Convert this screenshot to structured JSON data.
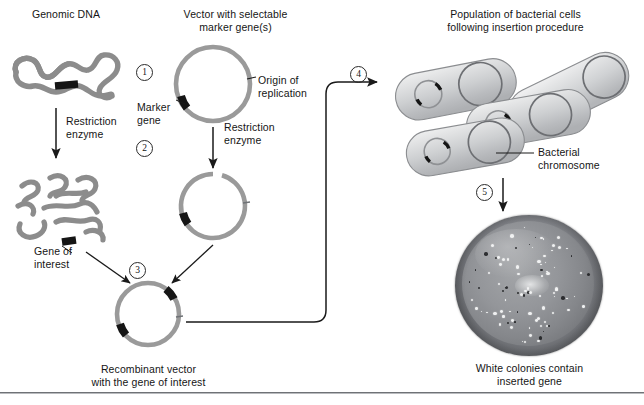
{
  "figure": {
    "title_genomic": "Genomic DNA",
    "title_vector_line1": "Vector with selectable",
    "title_vector_line2": "marker gene(s)",
    "title_population_line1": "Population of bacterial cells",
    "title_population_line2": "following insertion procedure"
  },
  "steps": [
    {
      "id": "step-1",
      "number": "1"
    },
    {
      "id": "step-2",
      "number": "2"
    },
    {
      "id": "step-3",
      "number": "3"
    },
    {
      "id": "step-4",
      "number": "4"
    },
    {
      "id": "step-5",
      "number": "5"
    }
  ],
  "labels": {
    "restriction_enzyme_left_line1": "Restriction",
    "restriction_enzyme_left_line2": "enzyme",
    "restriction_enzyme_right_line1": "Restriction",
    "restriction_enzyme_right_line2": "enzyme",
    "marker_gene_line1": "Marker",
    "marker_gene_line2": "gene",
    "origin_line1": "Origin of",
    "origin_line2": "replication",
    "gene_of_interest_line1": "Gene of",
    "gene_of_interest_line2": "interest",
    "recombinant_line1": "Recombinant vector",
    "recombinant_line2": "with the gene of interest",
    "bacterial_chromosome_line1": "Bacterial",
    "bacterial_chromosome_line2": "chromosome",
    "white_colonies_line1": "White colonies contain",
    "white_colonies_line2": "inserted gene"
  },
  "colors": {
    "dna_gray": "#8c8c8c",
    "dna_gray_dark": "#7a7a7a",
    "gene_black": "#151515",
    "arrow_black": "#1a1a1a",
    "cell_fill_light": "#e2e3e4",
    "cell_fill_mid": "#c6c8ca",
    "cell_outline": "#8b8d90",
    "chromosome_outline": "#6d6f73",
    "text": "#151515",
    "rule": "#6f7276",
    "background": "#ffffff"
  },
  "diagram": {
    "type": "process-flow",
    "stages": [
      "Genomic DNA containing gene of interest",
      "Plasmid vector with marker gene and origin of replication",
      "Restriction enzyme digestion of both genomic DNA and vector",
      "Ligation producing recombinant vector with the gene of interest",
      "Transformation into a population of bacterial cells",
      "Plating and selection: white colonies contain inserted gene"
    ],
    "objects": {
      "genomic_dna_intact": {
        "fragments": 1,
        "gene_segments": 1
      },
      "genomic_dna_cut": {
        "fragments": 9,
        "gene_segments": 1
      },
      "vector_intact": {
        "black_segments": 1,
        "cut_sites": 1,
        "gaps": 0
      },
      "vector_cut": {
        "black_segments": 1,
        "cut_sites": 1,
        "gaps": 1
      },
      "recombinant_vector": {
        "black_segments": 2,
        "cut_sites": 1,
        "gaps": 0
      },
      "bacterial_cells": {
        "count": 4,
        "plasmids_per_cell": 1,
        "chromosomes_per_cell": 1
      },
      "petri_dish": {
        "colony_count_visible": 90
      }
    }
  }
}
